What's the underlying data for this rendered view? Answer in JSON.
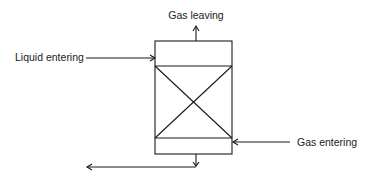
{
  "diagram": {
    "type": "packed-column-flow",
    "labels": {
      "gas_leaving": "Gas leaving",
      "liquid_entering": "Liquid entering",
      "gas_entering": "Gas entering"
    },
    "colors": {
      "line": "#1a1a1a",
      "background": "#ffffff"
    }
  }
}
